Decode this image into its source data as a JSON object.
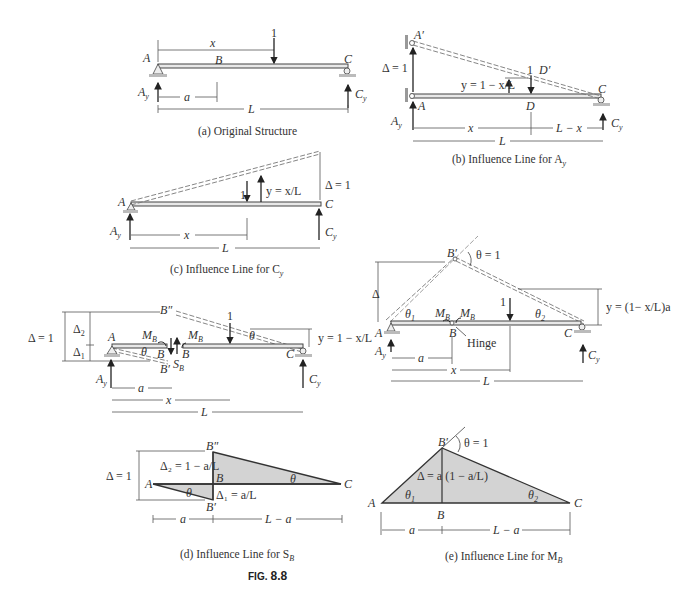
{
  "figure": {
    "label": "FIG.",
    "number": "8.8"
  },
  "panels": {
    "a": {
      "caption": "(a) Original Structure",
      "labels": {
        "A": "A",
        "B": "B",
        "C": "C",
        "x": "x",
        "load": "1",
        "Ay": "A",
        "Ay_sub": "y",
        "Cy": "C",
        "Cy_sub": "y",
        "a": "a",
        "L": "L"
      }
    },
    "b": {
      "caption": "(b) Influence Line for A",
      "caption_sub": "y",
      "labels": {
        "A_prime": "A′",
        "delta": "Δ = 1",
        "y_expr": "y = 1 − x/L",
        "load": "1",
        "D_prime": "D′",
        "A": "A",
        "D": "D",
        "C": "C",
        "Ay": "A",
        "Ay_sub": "y",
        "Cy": "C",
        "Cy_sub": "y",
        "x": "x",
        "L_minus_x": "L − x",
        "L": "L"
      }
    },
    "c": {
      "caption": "(c) Influence Line for C",
      "caption_sub": "y",
      "labels": {
        "A": "A",
        "C": "C",
        "load": "1",
        "y_expr": "y = x/L",
        "delta": "Δ = 1",
        "Ay": "A",
        "Ay_sub": "y",
        "Cy": "C",
        "Cy_sub": "y",
        "x": "x",
        "L": "L"
      }
    },
    "d_structure": {
      "labels": {
        "delta": "Δ = 1",
        "delta2": "Δ",
        "delta2_sub": "2",
        "delta1": "Δ",
        "delta1_sub": "1",
        "B_double_prime": "B″",
        "A": "A",
        "MB_left": "M",
        "MB_right": "M",
        "MB_sub": "B",
        "theta_left": "θ",
        "B_left": "B",
        "B_right": "B",
        "SB": "S",
        "SB_sub": "B",
        "B_prime": "B′",
        "load": "1",
        "theta_right": "θ",
        "C": "C",
        "y_expr": "y = 1 − x/L",
        "Ay": "A",
        "Ay_sub": "y",
        "Cy": "C",
        "Cy_sub": "y",
        "a": "a",
        "x": "x",
        "L": "L"
      }
    },
    "e_structure": {
      "labels": {
        "B_prime": "B′",
        "theta": "θ = 1",
        "delta": "Δ",
        "theta1": "θ",
        "theta1_sub": "1",
        "MB_left": "M",
        "MB_right": "M",
        "MB_sub": "B",
        "load": "1",
        "theta2": "θ",
        "theta2_sub": "2",
        "y_expr": "y = (1− x/L)a",
        "A": "A",
        "B": "B",
        "hinge": "Hinge",
        "C": "C",
        "Ay": "A",
        "Ay_sub": "y",
        "Cy": "C",
        "Cy_sub": "y",
        "a": "a",
        "x": "x",
        "L": "L"
      }
    },
    "d": {
      "caption": "(d) Influence Line for S",
      "caption_sub": "B",
      "labels": {
        "B_double_prime": "B″",
        "delta": "Δ = 1",
        "delta2_expr": "Δ₂ = 1 − a/L",
        "A": "A",
        "theta_left": "θ",
        "B": "B",
        "delta1_expr": "Δ₁ = a/L",
        "theta_right": "θ",
        "C": "C",
        "B_prime": "B′",
        "a": "a",
        "L_minus_a": "L − a"
      }
    },
    "e": {
      "caption": "(e) Influence Line for M",
      "caption_sub": "B",
      "labels": {
        "B_prime": "B′",
        "theta": "θ = 1",
        "delta_expr": "Δ = a (1 − a/L)",
        "A": "A",
        "theta1": "θ",
        "theta1_sub": "1",
        "theta2": "θ",
        "theta2_sub": "2",
        "B": "B",
        "C": "C",
        "a": "a",
        "L_minus_a": "L − a"
      }
    }
  }
}
